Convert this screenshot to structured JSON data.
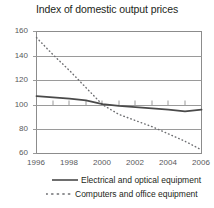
{
  "chart_data": {
    "type": "line",
    "title": "Index of domestic output prices",
    "xlabel": "",
    "ylabel": "",
    "x": [
      1996,
      1997,
      1998,
      1999,
      2000,
      2001,
      2002,
      2003,
      2004,
      2005,
      2006
    ],
    "xlim": [
      1996,
      2006
    ],
    "ylim": [
      60,
      160
    ],
    "yticks": [
      60,
      80,
      100,
      120,
      140,
      160
    ],
    "xticks": [
      1996,
      1998,
      2000,
      2002,
      2004,
      2006
    ],
    "ytick_labels": [
      "60",
      "80",
      "100",
      "120",
      "140",
      "160"
    ],
    "xtick_labels": [
      "1996",
      "1998",
      "2000",
      "2002",
      "2004",
      "2006"
    ],
    "grid": "horizontal",
    "legend_position": "below",
    "series": [
      {
        "name": "Electrical and optical equipment",
        "style": "solid",
        "color": "#4a4a4a",
        "values": [
          107,
          106,
          105,
          103.5,
          100.5,
          99,
          98,
          97,
          96,
          94.5,
          96
        ]
      },
      {
        "name": "Computers and office equipment",
        "style": "dotted",
        "color": "#6d6e71",
        "values": [
          155,
          141,
          128,
          114,
          100,
          92,
          87,
          82,
          76,
          70,
          63
        ]
      }
    ]
  },
  "axes": {
    "y_label_0": "160",
    "y_label_1": "140",
    "y_label_2": "120",
    "y_label_3": "100",
    "y_label_4": "80",
    "y_label_5": "60",
    "x_label_0": "1996",
    "x_label_1": "1998",
    "x_label_2": "2000",
    "x_label_3": "2002",
    "x_label_4": "2004",
    "x_label_5": "2006"
  },
  "legend": {
    "entry_0": "Electrical and optical equipment",
    "entry_1": "Computers and office equipment"
  },
  "colors": {
    "series_solid": "#4a4a4a",
    "series_dotted": "#6d6e71",
    "grid": "#9a9a9a",
    "frame": "#8c8c8c",
    "text": "#231f20",
    "tick_text": "#58595b",
    "background": "#ffffff"
  }
}
